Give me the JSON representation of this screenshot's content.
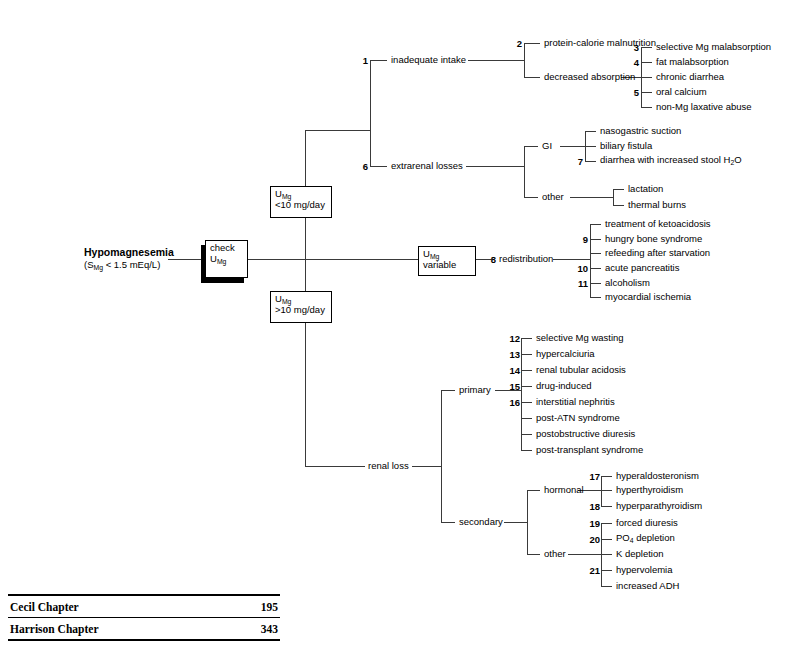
{
  "diagram": {
    "title": "Hypomagnesemia",
    "subtitle": "(S<sub>Mg</sub> < 1.5 mEq/L)",
    "subtitle_plain": "(SMg < 1.5 mEq/L)",
    "start_box": "check U<sub>Mg</sub>",
    "boxes": {
      "check": {
        "line1": "check",
        "line2": "U<sub>Mg</sub>"
      },
      "low": {
        "line1": "U<sub>Mg</sub>",
        "line2": "<10 mg/day"
      },
      "variable": {
        "line1": "U<sub>Mg</sub>",
        "line2": "variable"
      },
      "high": {
        "line1": "U<sub>Mg</sub>",
        "line2": ">10 mg/day"
      }
    },
    "branches": {
      "inadequate_intake": {
        "num": "1",
        "label": "inadequate intake",
        "children": [
          {
            "num": "2",
            "label": "protein-calorie malnutrition",
            "children": []
          },
          {
            "num": "",
            "label": "decreased absorption",
            "children": [
              {
                "num": "3",
                "label": "selective Mg malabsorption"
              },
              {
                "num": "4",
                "label": "fat malabsorption"
              },
              {
                "num": "",
                "label": "chronic diarrhea"
              },
              {
                "num": "5",
                "label": "oral calcium"
              },
              {
                "num": "",
                "label": "non-Mg laxative abuse"
              }
            ]
          }
        ]
      },
      "extrarenal_losses": {
        "num": "6",
        "label": "extrarenal losses",
        "children": [
          {
            "num": "",
            "label": "GI",
            "children": [
              {
                "num": "",
                "label": "nasogastric suction"
              },
              {
                "num": "",
                "label": "biliary fistula"
              },
              {
                "num": "7",
                "label": "diarrhea with increased stool H<sub>2</sub>O"
              }
            ]
          },
          {
            "num": "",
            "label": "other",
            "children": [
              {
                "num": "",
                "label": "lactation"
              },
              {
                "num": "",
                "label": "thermal burns"
              }
            ]
          }
        ]
      },
      "redistribution": {
        "num": "8",
        "label": "redistribution",
        "children": [
          {
            "num": "",
            "label": "treatment of ketoacidosis"
          },
          {
            "num": "9",
            "label": "hungry bone syndrome"
          },
          {
            "num": "",
            "label": "refeeding after starvation"
          },
          {
            "num": "10",
            "label": "acute pancreatitis"
          },
          {
            "num": "11",
            "label": "alcoholism"
          },
          {
            "num": "",
            "label": "myocardial ischemia"
          }
        ]
      },
      "renal_loss": {
        "num": "",
        "label": "renal loss",
        "children": [
          {
            "num": "",
            "label": "primary",
            "children": [
              {
                "num": "12",
                "label": "selective Mg wasting"
              },
              {
                "num": "13",
                "label": "hypercalciuria"
              },
              {
                "num": "14",
                "label": "renal tubular acidosis"
              },
              {
                "num": "15",
                "label": "drug-induced"
              },
              {
                "num": "16",
                "label": "interstitial nephritis"
              },
              {
                "num": "",
                "label": "post-ATN syndrome"
              },
              {
                "num": "",
                "label": "postobstructive diuresis"
              },
              {
                "num": "",
                "label": "post-transplant syndrome"
              }
            ]
          },
          {
            "num": "",
            "label": "secondary",
            "children": [
              {
                "num": "",
                "label": "hormonal",
                "children": [
                  {
                    "num": "17",
                    "label": "hyperaldosteronism"
                  },
                  {
                    "num": "",
                    "label": "hyperthyroidism"
                  },
                  {
                    "num": "18",
                    "label": "hyperparathyroidism"
                  }
                ]
              },
              {
                "num": "",
                "label": "other",
                "children": [
                  {
                    "num": "19",
                    "label": "forced diuresis"
                  },
                  {
                    "num": "20",
                    "label": "PO<sub>4</sub> depletion"
                  },
                  {
                    "num": "",
                    "label": "K depletion"
                  },
                  {
                    "num": "21",
                    "label": "hypervolemia"
                  },
                  {
                    "num": "",
                    "label": "increased ADH"
                  }
                ]
              }
            ]
          }
        ]
      }
    }
  },
  "reference_table": {
    "rows": [
      {
        "label": "Cecil Chapter",
        "value": "195"
      },
      {
        "label": "Harrison Chapter",
        "value": "343"
      }
    ]
  },
  "colors": {
    "ink": "#000000",
    "line": "#3a3a3a",
    "background": "#ffffff"
  }
}
